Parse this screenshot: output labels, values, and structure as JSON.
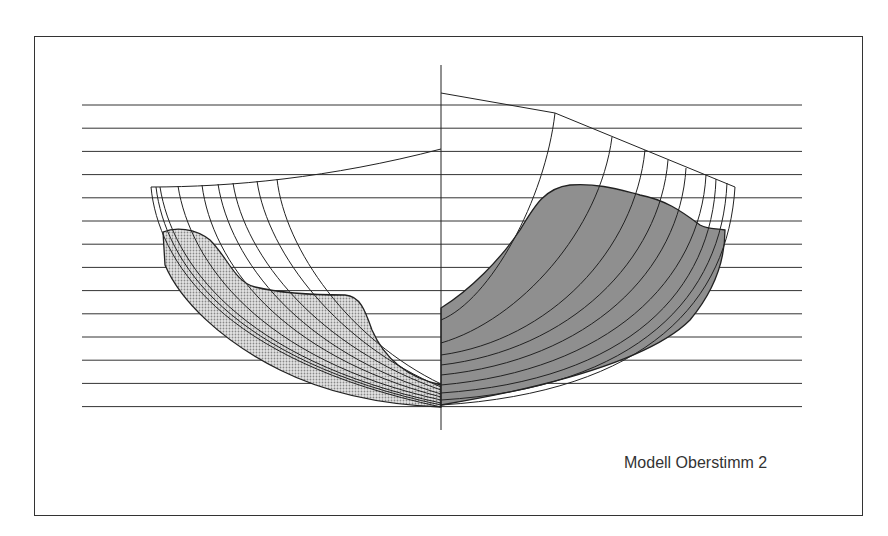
{
  "caption": "Modell Oberstimm 2",
  "diagram": {
    "type": "hull body plan",
    "waterlines": {
      "count": 14,
      "x_start": 82,
      "x_end": 802,
      "y_first": 105,
      "spacing": 23.2
    },
    "centerline": {
      "x": 441,
      "y_top": 65,
      "y_bottom": 430
    },
    "left_half": {
      "description": "aft sections, light dotted shading",
      "fill": "#cfcfcf"
    },
    "right_half": {
      "description": "fore sections, dark stippled shading",
      "fill": "#8f8f8f"
    },
    "line_color": "#222222"
  }
}
